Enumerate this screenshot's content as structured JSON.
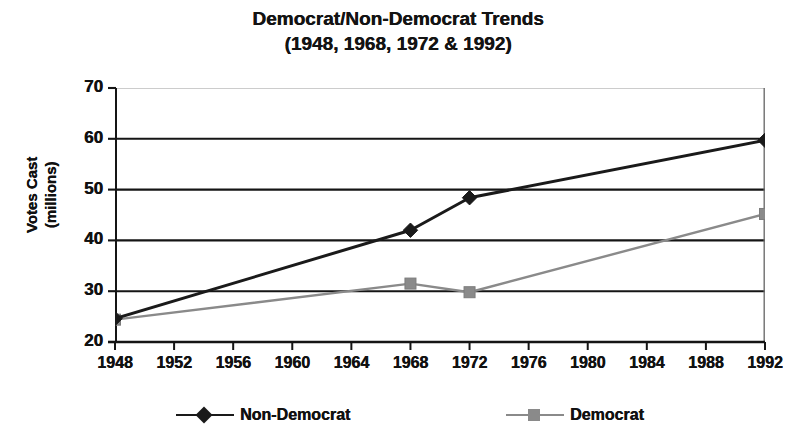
{
  "title": {
    "line1": "Democrat/Non-Democrat Trends",
    "line2": "(1948, 1968, 1972 & 1992)"
  },
  "axis": {
    "ylabel_line1": "Votes Cast",
    "ylabel_line2": "(millions)"
  },
  "legend": {
    "items": [
      {
        "label": "Non-Democrat",
        "color": "#1a1a1a",
        "marker": "diamond"
      },
      {
        "label": "Democrat",
        "color": "#8a8a8a",
        "marker": "square"
      }
    ]
  },
  "chart_data": {
    "type": "line",
    "title": "Democrat/Non-Democrat Trends (1948, 1968, 1972 & 1992)",
    "xlabel": "",
    "ylabel": "Votes Cast (millions)",
    "categories": [
      "1948",
      "1952",
      "1956",
      "1960",
      "1964",
      "1968",
      "1972",
      "1976",
      "1980",
      "1984",
      "1988",
      "1992"
    ],
    "xticklabels": [
      "1948",
      "1952",
      "1956",
      "1960",
      "1964",
      "1968",
      "1972",
      "1976",
      "1980",
      "1984",
      "1988",
      "1992"
    ],
    "yticklabels": [
      "70",
      "60",
      "50",
      "40",
      "30",
      "20"
    ],
    "ylim": [
      20,
      70
    ],
    "ytick_step": 10,
    "grid": true,
    "grid_axis": "y",
    "legend_position": "bottom",
    "marker_years": [
      "1948",
      "1968",
      "1972",
      "1992"
    ],
    "series": [
      {
        "name": "Non-Democrat",
        "color": "#1a1a1a",
        "marker": "diamond",
        "x": [
          "1948",
          "1968",
          "1972",
          "1992"
        ],
        "values": [
          24.6,
          42.0,
          48.4,
          59.7
        ]
      },
      {
        "name": "Democrat",
        "color": "#8a8a8a",
        "marker": "square",
        "x": [
          "1948",
          "1968",
          "1972",
          "1992"
        ],
        "values": [
          24.4,
          31.5,
          29.8,
          45.2
        ]
      }
    ]
  }
}
